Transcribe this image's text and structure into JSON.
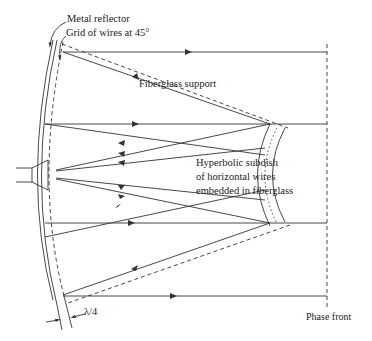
{
  "diagram": {
    "labels": {
      "metal_reflector": "Metal reflector",
      "grid_of_wires": "Grid of wires at 45°",
      "fiberglass_support": "Fiberglass support",
      "subdish_line1": "Hyperbolic subdish",
      "subdish_line2": "of horizontal wires",
      "subdish_line3": "embedded in fiberglass",
      "lambda_quarter": "λ/4",
      "phase_front": "Phase front"
    },
    "components": [
      "metal-reflector",
      "wire-grid-45deg",
      "fiberglass-support",
      "hyperbolic-subdish",
      "feed-horn",
      "phase-front"
    ],
    "colors": {
      "line": "#333333",
      "background": "#ffffff"
    }
  }
}
